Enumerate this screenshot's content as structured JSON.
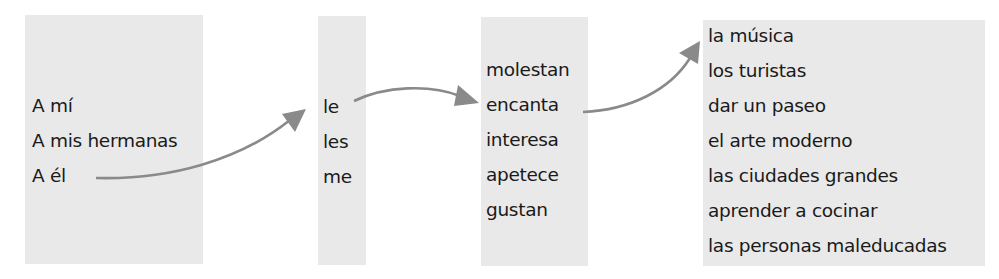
{
  "diagram": {
    "columns": [
      {
        "id": "subject",
        "items": [
          "A mí",
          "A mis hermanas",
          "A él"
        ]
      },
      {
        "id": "pronoun",
        "items": [
          "le",
          "les",
          "me"
        ]
      },
      {
        "id": "verb",
        "items": [
          "molestan",
          "encanta",
          "interesa",
          "apetece",
          "gustan"
        ]
      },
      {
        "id": "object",
        "items": [
          "la música",
          "los turistas",
          "dar un paseo",
          "el arte moderno",
          "las ciudades grandes",
          "aprender a cocinar",
          "las personas maleducadas"
        ]
      }
    ],
    "connections": [
      {
        "from": "A él",
        "to": "le"
      },
      {
        "from": "le",
        "to": "encanta"
      },
      {
        "from": "encanta",
        "to": "la música"
      }
    ],
    "colors": {
      "box_background": "#e9e9e9",
      "arrow": "#8a8a8a",
      "text": "#1a1a1a"
    }
  }
}
